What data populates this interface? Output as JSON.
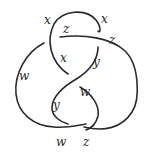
{
  "diagram": {
    "type": "knot-diagram",
    "labels": [
      {
        "text": "x",
        "x": 44,
        "y": 24
      },
      {
        "text": "x",
        "x": 101,
        "y": 23
      },
      {
        "text": "z",
        "x": 63,
        "y": 33
      },
      {
        "text": "z",
        "x": 109,
        "y": 44
      },
      {
        "text": "x",
        "x": 60,
        "y": 62
      },
      {
        "text": "y",
        "x": 93,
        "y": 66
      },
      {
        "text": "w",
        "x": 19,
        "y": 80
      },
      {
        "text": "w",
        "x": 80,
        "y": 96
      },
      {
        "text": "y",
        "x": 53,
        "y": 109
      },
      {
        "text": "w",
        "x": 56,
        "y": 146
      },
      {
        "text": "z",
        "x": 83,
        "y": 146
      }
    ],
    "stroke_color": "#2a2a2a",
    "background": "#ffffff"
  }
}
